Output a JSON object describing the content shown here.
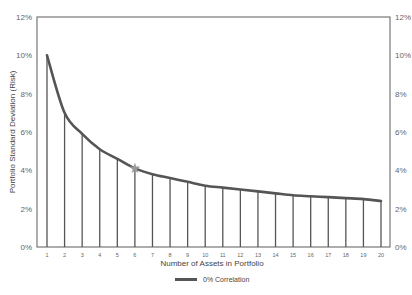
{
  "chart_data": {
    "type": "line",
    "title": "",
    "xlabel": "Number of Assets in Portfolio",
    "ylabel": "Portfolio Standard Deviation (Risk)",
    "x": [
      1,
      2,
      3,
      4,
      5,
      6,
      7,
      8,
      9,
      10,
      11,
      12,
      13,
      14,
      15,
      16,
      17,
      18,
      19,
      20
    ],
    "series": [
      {
        "name": "0% Correlation",
        "values": [
          10.0,
          7.0,
          5.9,
          5.1,
          4.6,
          4.1,
          3.8,
          3.6,
          3.4,
          3.2,
          3.1,
          3.0,
          2.9,
          2.8,
          2.7,
          2.65,
          2.6,
          2.55,
          2.5,
          2.4
        ],
        "color": "#555555",
        "drop_lines": true
      }
    ],
    "annotations": [
      {
        "type": "star-marker",
        "x": 6,
        "y": 4.1,
        "color": "#999999"
      }
    ],
    "ylim": [
      0,
      12
    ],
    "yticks": [
      "0%",
      "2%",
      "4%",
      "6%",
      "8%",
      "10%",
      "12%"
    ],
    "yticks_right": [
      "0%",
      "2%",
      "4%",
      "6%",
      "8%",
      "10%",
      "12%"
    ],
    "xticks": [
      "1",
      "2",
      "3",
      "4",
      "5",
      "6",
      "7",
      "8",
      "9",
      "10",
      "11",
      "12",
      "13",
      "14",
      "15",
      "16",
      "17",
      "18",
      "19",
      "20"
    ],
    "grid": false,
    "legend_position": "bottom-center"
  },
  "legend": {
    "label": "0% Correlation"
  },
  "axes": {
    "xlabel": "Number of Assets in Portfolio",
    "ylabel": "Portfolio Standard Deviation (Risk)"
  }
}
